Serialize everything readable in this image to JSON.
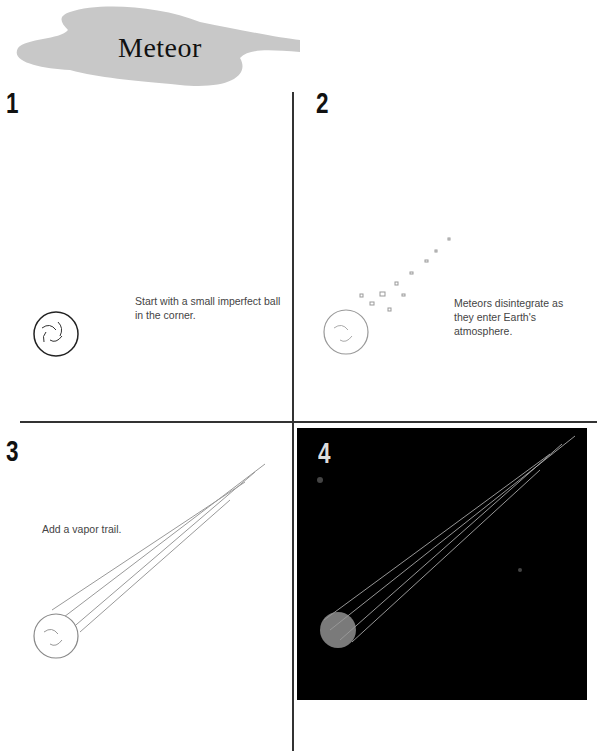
{
  "title": "Meteor",
  "steps": [
    {
      "number": "1",
      "caption": "Start with a small imperfect ball in the corner."
    },
    {
      "number": "2",
      "caption": "Meteors disintegrate as they enter Earth's atmosphere."
    },
    {
      "number": "3",
      "caption": "Add a vapor trail."
    },
    {
      "number": "4",
      "caption": ""
    }
  ],
  "colors": {
    "cloud": "#c8c8c8",
    "panel4_bg": "#000000"
  }
}
